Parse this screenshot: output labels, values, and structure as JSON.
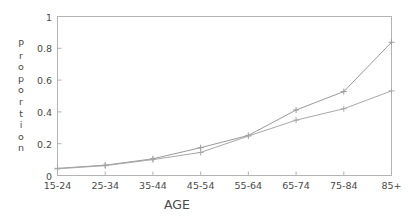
{
  "chart_data": {
    "type": "line",
    "title": "",
    "xlabel": "AGE",
    "ylabel": "Proportion",
    "categories": [
      "15-24",
      "25-34",
      "35-44",
      "45-54",
      "55-64",
      "65-74",
      "75-84",
      "85+"
    ],
    "ylim": [
      0,
      1
    ],
    "yticks": [
      "0",
      "0.2",
      "0.4",
      "0.6",
      "0.8",
      "1"
    ],
    "ytick_values": [
      0,
      0.2,
      0.4,
      0.6,
      0.8,
      1
    ],
    "grid": false,
    "legend": "none",
    "marker": "plus",
    "series": [
      {
        "name": "series-1",
        "color": "#9a9a9a",
        "values": [
          0.045,
          0.065,
          0.105,
          0.175,
          0.252,
          0.412,
          0.528,
          0.838
        ]
      },
      {
        "name": "series-2",
        "color": "#a8a8a8",
        "values": [
          0.042,
          0.062,
          0.1,
          0.145,
          0.248,
          0.348,
          0.42,
          0.532
        ]
      }
    ]
  },
  "axis": {
    "y_title_letters": [
      "P",
      "r",
      "o",
      "p",
      "o",
      "r",
      "t",
      "i",
      "o",
      "n"
    ],
    "x_title": "AGE"
  },
  "colors": {
    "background": "#ffffff",
    "frame": "#b4b4b4",
    "text": "#4a4a4a"
  }
}
